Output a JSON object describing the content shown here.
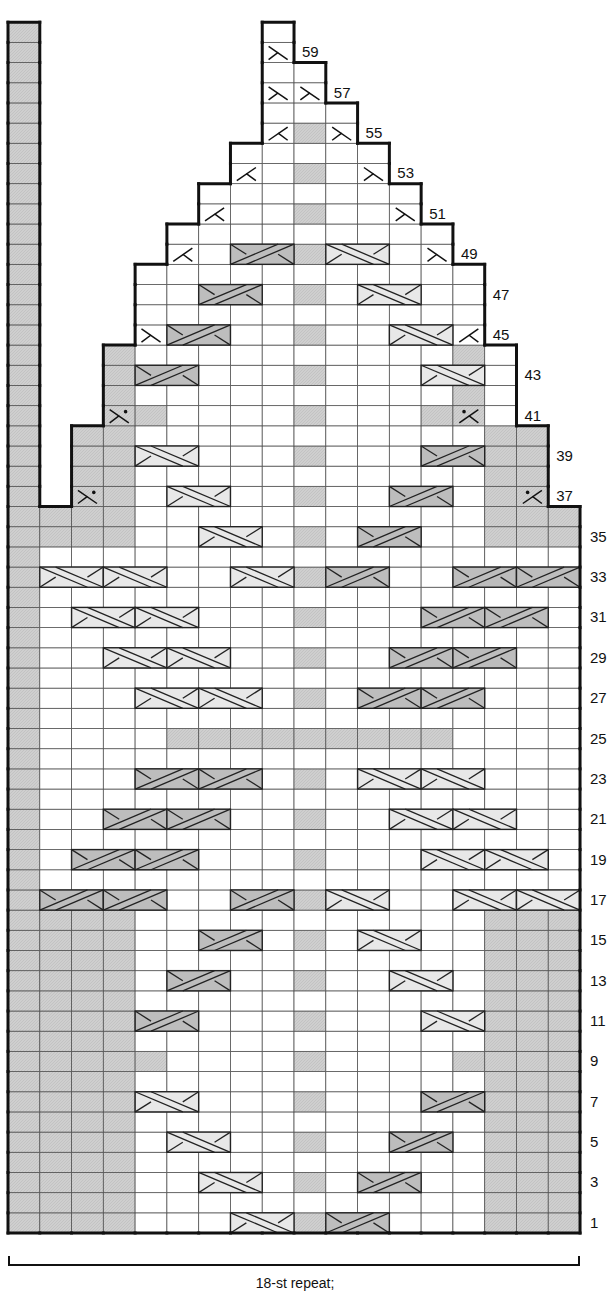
{
  "chart_data": {
    "type": "table",
    "grid": {
      "columns": 18,
      "rows": 60,
      "left": 8,
      "bottom": 1233,
      "cell_w": 31.78,
      "cell_h": 20.18
    },
    "colors": {
      "line": "#555555",
      "outline": "#111111",
      "purl_gray": "#cfcfcf",
      "right_cross_fill": "#e8e8e8",
      "left_cross_fill": "#bdbdbd",
      "background": "#ffffff"
    },
    "row_extents": [
      {
        "rows": [
          1,
          36
        ],
        "cols": [
          1,
          17
        ]
      },
      {
        "rows": [
          37,
          40
        ],
        "cols": [
          2,
          16
        ]
      },
      {
        "rows": [
          41,
          44
        ],
        "cols": [
          3,
          15
        ]
      },
      {
        "rows": [
          45,
          48
        ],
        "cols": [
          4,
          14
        ]
      },
      {
        "rows": [
          49,
          50
        ],
        "cols": [
          5,
          13
        ]
      },
      {
        "rows": [
          51,
          52
        ],
        "cols": [
          6,
          12
        ]
      },
      {
        "rows": [
          53,
          54
        ],
        "cols": [
          7,
          11
        ]
      },
      {
        "rows": [
          55,
          56
        ],
        "cols": [
          8,
          10
        ]
      },
      {
        "rows": [
          57,
          58
        ],
        "cols": [
          8,
          9
        ]
      },
      {
        "rows": [
          59,
          60
        ],
        "cols": [
          8,
          8
        ]
      }
    ],
    "edge_column": {
      "col": 0,
      "rows": [
        1,
        60
      ],
      "shade": "gray"
    },
    "gray_ranges": [
      {
        "rows": [
          1,
          16
        ],
        "cols": [
          1,
          3
        ]
      },
      {
        "rows": [
          1,
          16
        ],
        "cols": [
          15,
          17
        ]
      },
      {
        "rows": [
          9,
          9
        ],
        "cols": [
          4,
          4
        ]
      },
      {
        "rows": [
          9,
          9
        ],
        "cols": [
          14,
          14
        ]
      },
      {
        "rows": [
          25,
          25
        ],
        "cols": [
          5,
          13
        ]
      },
      {
        "rows": [
          35,
          36
        ],
        "cols": [
          1,
          3
        ]
      },
      {
        "rows": [
          35,
          36
        ],
        "cols": [
          15,
          17
        ]
      },
      {
        "rows": [
          37,
          40
        ],
        "cols": [
          2,
          3
        ]
      },
      {
        "rows": [
          37,
          40
        ],
        "cols": [
          15,
          16
        ]
      },
      {
        "rows": [
          41,
          44
        ],
        "cols": [
          3,
          3
        ]
      },
      {
        "rows": [
          41,
          44
        ],
        "cols": [
          14,
          14
        ]
      },
      {
        "rows": [
          41,
          41
        ],
        "cols": [
          4,
          4
        ]
      },
      {
        "rows": [
          41,
          41
        ],
        "cols": [
          13,
          13
        ]
      }
    ],
    "center_gray": {
      "col": 9,
      "rows": [
        1,
        3,
        5,
        7,
        9,
        11,
        13,
        15,
        17,
        19,
        21,
        23,
        27,
        29,
        31,
        33,
        35,
        37,
        39,
        41,
        43,
        45,
        47,
        49,
        51,
        53,
        55
      ]
    },
    "cables": [
      {
        "row": 1,
        "col": 7,
        "type": "R"
      },
      {
        "row": 1,
        "col": 10,
        "type": "L"
      },
      {
        "row": 3,
        "col": 6,
        "type": "R"
      },
      {
        "row": 3,
        "col": 11,
        "type": "L"
      },
      {
        "row": 5,
        "col": 5,
        "type": "R"
      },
      {
        "row": 5,
        "col": 12,
        "type": "L"
      },
      {
        "row": 7,
        "col": 4,
        "type": "R"
      },
      {
        "row": 7,
        "col": 13,
        "type": "L"
      },
      {
        "row": 11,
        "col": 4,
        "type": "L"
      },
      {
        "row": 11,
        "col": 13,
        "type": "R"
      },
      {
        "row": 13,
        "col": 5,
        "type": "L"
      },
      {
        "row": 13,
        "col": 12,
        "type": "R"
      },
      {
        "row": 15,
        "col": 6,
        "type": "L"
      },
      {
        "row": 15,
        "col": 11,
        "type": "R"
      },
      {
        "row": 17,
        "col": 1,
        "type": "L"
      },
      {
        "row": 17,
        "col": 3,
        "type": "L"
      },
      {
        "row": 17,
        "col": 7,
        "type": "L"
      },
      {
        "row": 17,
        "col": 10,
        "type": "R"
      },
      {
        "row": 17,
        "col": 14,
        "type": "R"
      },
      {
        "row": 17,
        "col": 16,
        "type": "R"
      },
      {
        "row": 19,
        "col": 2,
        "type": "L"
      },
      {
        "row": 19,
        "col": 4,
        "type": "L"
      },
      {
        "row": 19,
        "col": 13,
        "type": "R"
      },
      {
        "row": 19,
        "col": 15,
        "type": "R"
      },
      {
        "row": 21,
        "col": 3,
        "type": "L"
      },
      {
        "row": 21,
        "col": 5,
        "type": "L"
      },
      {
        "row": 21,
        "col": 12,
        "type": "R"
      },
      {
        "row": 21,
        "col": 14,
        "type": "R"
      },
      {
        "row": 23,
        "col": 4,
        "type": "L"
      },
      {
        "row": 23,
        "col": 6,
        "type": "L"
      },
      {
        "row": 23,
        "col": 11,
        "type": "R"
      },
      {
        "row": 23,
        "col": 13,
        "type": "R"
      },
      {
        "row": 27,
        "col": 4,
        "type": "R"
      },
      {
        "row": 27,
        "col": 6,
        "type": "R"
      },
      {
        "row": 27,
        "col": 11,
        "type": "L"
      },
      {
        "row": 27,
        "col": 13,
        "type": "L"
      },
      {
        "row": 29,
        "col": 3,
        "type": "R"
      },
      {
        "row": 29,
        "col": 5,
        "type": "R"
      },
      {
        "row": 29,
        "col": 12,
        "type": "L"
      },
      {
        "row": 29,
        "col": 14,
        "type": "L"
      },
      {
        "row": 31,
        "col": 2,
        "type": "R"
      },
      {
        "row": 31,
        "col": 4,
        "type": "R"
      },
      {
        "row": 31,
        "col": 13,
        "type": "L"
      },
      {
        "row": 31,
        "col": 15,
        "type": "L"
      },
      {
        "row": 33,
        "col": 1,
        "type": "R"
      },
      {
        "row": 33,
        "col": 3,
        "type": "R"
      },
      {
        "row": 33,
        "col": 7,
        "type": "R"
      },
      {
        "row": 33,
        "col": 10,
        "type": "L"
      },
      {
        "row": 33,
        "col": 14,
        "type": "L"
      },
      {
        "row": 33,
        "col": 16,
        "type": "L"
      },
      {
        "row": 35,
        "col": 6,
        "type": "R"
      },
      {
        "row": 35,
        "col": 11,
        "type": "L"
      },
      {
        "row": 37,
        "col": 5,
        "type": "R"
      },
      {
        "row": 37,
        "col": 12,
        "type": "L"
      },
      {
        "row": 39,
        "col": 4,
        "type": "R"
      },
      {
        "row": 39,
        "col": 13,
        "type": "L"
      },
      {
        "row": 43,
        "col": 4,
        "type": "L"
      },
      {
        "row": 43,
        "col": 13,
        "type": "R"
      },
      {
        "row": 45,
        "col": 5,
        "type": "L"
      },
      {
        "row": 45,
        "col": 12,
        "type": "R"
      },
      {
        "row": 47,
        "col": 6,
        "type": "L"
      },
      {
        "row": 47,
        "col": 11,
        "type": "R"
      },
      {
        "row": 49,
        "col": 7,
        "type": "L"
      },
      {
        "row": 49,
        "col": 10,
        "type": "R"
      }
    ],
    "decreases": [
      {
        "row": 37,
        "col": 2,
        "type": "purl-dec-left"
      },
      {
        "row": 37,
        "col": 16,
        "type": "purl-dec-right"
      },
      {
        "row": 41,
        "col": 3,
        "type": "purl-dec-left"
      },
      {
        "row": 41,
        "col": 14,
        "type": "purl-dec-right"
      },
      {
        "row": 45,
        "col": 4,
        "type": "ssk"
      },
      {
        "row": 45,
        "col": 14,
        "type": "k2tog"
      },
      {
        "row": 49,
        "col": 5,
        "type": "k2tog"
      },
      {
        "row": 49,
        "col": 13,
        "type": "ssk"
      },
      {
        "row": 51,
        "col": 6,
        "type": "k2tog"
      },
      {
        "row": 51,
        "col": 12,
        "type": "ssk"
      },
      {
        "row": 53,
        "col": 7,
        "type": "k2tog"
      },
      {
        "row": 53,
        "col": 11,
        "type": "ssk"
      },
      {
        "row": 55,
        "col": 8,
        "type": "k2tog"
      },
      {
        "row": 55,
        "col": 10,
        "type": "ssk"
      },
      {
        "row": 57,
        "col": 8,
        "type": "ssk"
      },
      {
        "row": 57,
        "col": 9,
        "type": "ssk"
      },
      {
        "row": 59,
        "col": 8,
        "type": "ssk"
      }
    ],
    "row_labels": [
      {
        "row": 1,
        "text": "1"
      },
      {
        "row": 3,
        "text": "3"
      },
      {
        "row": 5,
        "text": "5"
      },
      {
        "row": 7,
        "text": "7"
      },
      {
        "row": 9,
        "text": "9"
      },
      {
        "row": 11,
        "text": "11"
      },
      {
        "row": 13,
        "text": "13"
      },
      {
        "row": 15,
        "text": "15"
      },
      {
        "row": 17,
        "text": "17"
      },
      {
        "row": 19,
        "text": "19"
      },
      {
        "row": 21,
        "text": "21"
      },
      {
        "row": 23,
        "text": "23"
      },
      {
        "row": 25,
        "text": "25"
      },
      {
        "row": 27,
        "text": "27"
      },
      {
        "row": 29,
        "text": "29"
      },
      {
        "row": 31,
        "text": "31"
      },
      {
        "row": 33,
        "text": "33"
      },
      {
        "row": 35,
        "text": "35"
      },
      {
        "row": 37,
        "text": "37"
      },
      {
        "row": 39,
        "text": "39"
      },
      {
        "row": 41,
        "text": "41"
      },
      {
        "row": 43,
        "text": "43"
      },
      {
        "row": 45,
        "text": "45"
      },
      {
        "row": 47,
        "text": "47"
      },
      {
        "row": 49,
        "text": "49"
      },
      {
        "row": 51,
        "text": "51"
      },
      {
        "row": 53,
        "text": "53"
      },
      {
        "row": 55,
        "text": "55"
      },
      {
        "row": 57,
        "text": "57"
      },
      {
        "row": 59,
        "text": "59"
      }
    ],
    "footer": "18-st repeat;"
  },
  "footer": {
    "repeat_label": "18-st repeat;"
  }
}
